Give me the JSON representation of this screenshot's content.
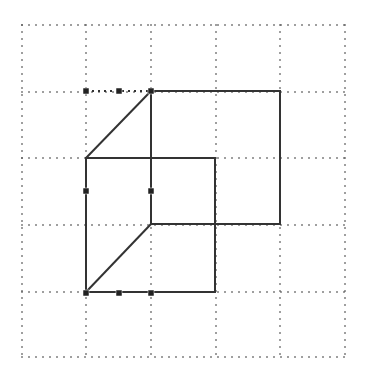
{
  "canvas": {
    "width": 366,
    "height": 373,
    "background": "#ffffff"
  },
  "grid": {
    "color": "#555555",
    "dot_spacing": 7,
    "vertical_lines_x": [
      22,
      86,
      151,
      216,
      280,
      345
    ],
    "horizontal_lines_y": [
      25,
      92,
      158,
      225,
      292,
      357
    ],
    "x_range": [
      22,
      345
    ],
    "y_range": [
      25,
      357
    ]
  },
  "shapes": {
    "stroke_color": "#333333",
    "stroke_width": 2,
    "back_square": {
      "x1": 151,
      "y1": 91,
      "x2": 280,
      "y2": 224
    },
    "front_square": {
      "x1": 86,
      "y1": 158,
      "x2": 215,
      "y2": 292
    },
    "connectors": [
      {
        "x1": 86,
        "y1": 158,
        "x2": 151,
        "y2": 91
      },
      {
        "x1": 86,
        "y1": 292,
        "x2": 151,
        "y2": 224
      }
    ]
  },
  "selection_guides": {
    "color": "#333333",
    "lines": [
      {
        "x1": 86,
        "y1": 91,
        "x2": 151,
        "y2": 91
      }
    ]
  },
  "handles": {
    "color": "#222222",
    "size": 6,
    "points": [
      {
        "x": 86,
        "y": 91
      },
      {
        "x": 119,
        "y": 91
      },
      {
        "x": 151,
        "y": 91
      },
      {
        "x": 86,
        "y": 191
      },
      {
        "x": 151,
        "y": 191
      },
      {
        "x": 86,
        "y": 293
      },
      {
        "x": 119,
        "y": 293
      },
      {
        "x": 151,
        "y": 293
      }
    ]
  }
}
